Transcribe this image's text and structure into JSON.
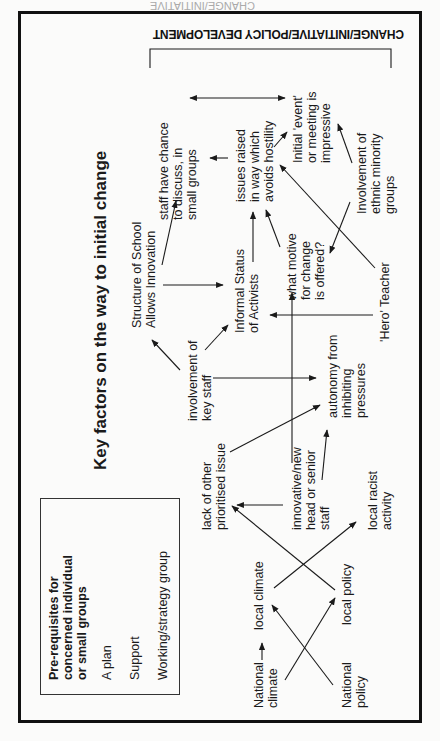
{
  "header_strip": "CHANGE/INITIATIVE",
  "top_band": "CHANGE/INITIATIVE/POLICY DEVELOPMENT",
  "title": "Key factors on the way to initial change",
  "prerequisites": {
    "heading": "Pre-requisites for\nconcerned individual\nor small groups",
    "items": [
      "A plan",
      "Support",
      "Working/strategy group"
    ]
  },
  "nodes": {
    "national_climate": "National\nclimate",
    "national_policy": "National\npolicy",
    "local_climate": "local climate",
    "local_policy": "local policy",
    "lack_issue": "lack of other\nprioritised issue",
    "innovative_head": "innovative/new\nhead or senior\nstaff",
    "local_racist": "local racist\nactivity",
    "involvement_key_staff": "involvement of\nkey staff",
    "autonomy": "autonomy from\ninhibiting\npressures",
    "structure_school": "Structure of School\nAllows Innovation",
    "informal_status": "Informal Status\nof Activists",
    "hero_teacher": "'Hero' Teacher",
    "what_motive": "what motive\nfor change\nis offered?",
    "staff_discuss": "staff have chance\nto discuss, in\nsmall groups",
    "issues_raised": "issues raised\nin way which\navoids hostility",
    "initial_event": "Initial 'event'\nor meeting is\nimpressive",
    "ethnic_minority": "Involvement of\nethnic minority\ngroups"
  },
  "colors": {
    "ink": "#1a1a1a",
    "background": "#fbfbfa",
    "frame": "#111111"
  }
}
